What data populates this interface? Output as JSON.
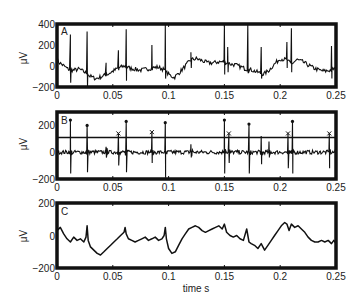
{
  "chart_data": [
    {
      "panel": "A",
      "type": "line",
      "title": "",
      "panel_label": "A",
      "xlabel": "",
      "ylabel": "μV",
      "xlim": [
        0,
        0.25
      ],
      "ylim": [
        -200,
        400
      ],
      "xticks": [
        "0",
        "0.05",
        "0.1",
        "0.15",
        "0.2",
        "0.25"
      ],
      "yticks": [
        "400",
        "200",
        "0",
        "−200"
      ],
      "ytick_values": [
        400,
        200,
        0,
        -200
      ],
      "grid": false,
      "baseline": {
        "x": [
          0,
          0.005,
          0.01,
          0.015,
          0.02,
          0.025,
          0.03,
          0.035,
          0.04,
          0.045,
          0.05,
          0.055,
          0.06,
          0.065,
          0.07,
          0.075,
          0.08,
          0.085,
          0.09,
          0.095,
          0.1,
          0.105,
          0.11,
          0.115,
          0.12,
          0.125,
          0.13,
          0.135,
          0.14,
          0.145,
          0.15,
          0.155,
          0.16,
          0.165,
          0.17,
          0.175,
          0.18,
          0.185,
          0.19,
          0.195,
          0.2,
          0.205,
          0.21,
          0.215,
          0.22,
          0.225,
          0.23,
          0.235,
          0.24,
          0.245,
          0.25
        ],
        "y": [
          50,
          10,
          -30,
          -40,
          -30,
          -60,
          -100,
          -120,
          -100,
          -80,
          -50,
          -20,
          0,
          -20,
          -30,
          -40,
          -30,
          -20,
          -10,
          -30,
          -80,
          -110,
          -60,
          0,
          60,
          70,
          50,
          30,
          30,
          40,
          40,
          20,
          10,
          -10,
          -30,
          -40,
          -60,
          -80,
          -40,
          20,
          70,
          60,
          20,
          60,
          40,
          10,
          -20,
          -40,
          -50,
          -40,
          -20
        ]
      },
      "spikes": [
        {
          "x": 0.012,
          "peak": 300,
          "trough": -160
        },
        {
          "x": 0.027,
          "peak": 330,
          "trough": -200
        },
        {
          "x": 0.044,
          "peak": 30,
          "trough": -60
        },
        {
          "x": 0.055,
          "peak": 150,
          "trough": -40
        },
        {
          "x": 0.062,
          "peak": 350,
          "trough": -140
        },
        {
          "x": 0.085,
          "peak": 200,
          "trough": -40
        },
        {
          "x": 0.097,
          "peak": 400,
          "trough": -120
        },
        {
          "x": 0.12,
          "peak": 130,
          "trough": -20
        },
        {
          "x": 0.15,
          "peak": 390,
          "trough": -80
        },
        {
          "x": 0.153,
          "peak": 180,
          "trough": -60
        },
        {
          "x": 0.171,
          "peak": 400,
          "trough": -70
        },
        {
          "x": 0.183,
          "peak": 180,
          "trough": -120
        },
        {
          "x": 0.206,
          "peak": 230,
          "trough": -20
        },
        {
          "x": 0.21,
          "peak": 360,
          "trough": -60
        },
        {
          "x": 0.246,
          "peak": 190,
          "trough": -120
        }
      ]
    },
    {
      "panel": "B",
      "type": "line",
      "title": "",
      "panel_label": "B",
      "xlabel": "",
      "ylabel": "μV",
      "xlim": [
        0,
        0.25
      ],
      "ylim": [
        -200,
        300
      ],
      "xticks": [
        "0",
        "0.05",
        "0.1",
        "0.15",
        "0.2",
        "0.25"
      ],
      "yticks": [
        "200",
        "0",
        "−200"
      ],
      "ytick_values": [
        200,
        0,
        -200
      ],
      "grid": false,
      "threshold": 110,
      "spikes": [
        {
          "x": 0.012,
          "peak": 240,
          "trough": -160,
          "marker": "dot"
        },
        {
          "x": 0.027,
          "peak": 200,
          "trough": -150,
          "marker": "dot"
        },
        {
          "x": 0.044,
          "peak": 40,
          "trough": -40,
          "marker": "none"
        },
        {
          "x": 0.055,
          "peak": 140,
          "trough": -100,
          "marker": "x"
        },
        {
          "x": 0.062,
          "peak": 230,
          "trough": -150,
          "marker": "dot"
        },
        {
          "x": 0.085,
          "peak": 150,
          "trough": -80,
          "marker": "x"
        },
        {
          "x": 0.097,
          "peak": 220,
          "trough": -190,
          "marker": "dot"
        },
        {
          "x": 0.12,
          "peak": 60,
          "trough": -40,
          "marker": "none"
        },
        {
          "x": 0.15,
          "peak": 240,
          "trough": -160,
          "marker": "dot"
        },
        {
          "x": 0.154,
          "peak": 140,
          "trough": -80,
          "marker": "x"
        },
        {
          "x": 0.172,
          "peak": 210,
          "trough": -160,
          "marker": "dot"
        },
        {
          "x": 0.183,
          "peak": 120,
          "trough": -90,
          "marker": "none"
        },
        {
          "x": 0.19,
          "peak": 80,
          "trough": -40,
          "marker": "none"
        },
        {
          "x": 0.207,
          "peak": 140,
          "trough": -120,
          "marker": "x"
        },
        {
          "x": 0.211,
          "peak": 230,
          "trough": -160,
          "marker": "dot"
        },
        {
          "x": 0.244,
          "peak": 140,
          "trough": -120,
          "marker": "x"
        }
      ]
    },
    {
      "panel": "C",
      "type": "line",
      "title": "",
      "panel_label": "C",
      "xlabel": "time s",
      "ylabel": "μV",
      "xlim": [
        0,
        0.25
      ],
      "ylim": [
        -200,
        200
      ],
      "xticks": [
        "0",
        "0.05",
        "0.1",
        "0.15",
        "0.2",
        "0.25"
      ],
      "yticks": [
        "200",
        "0",
        "−200"
      ],
      "ytick_values": [
        200,
        0,
        -200
      ],
      "grid": false,
      "x": [
        0,
        0.003,
        0.006,
        0.009,
        0.012,
        0.015,
        0.018,
        0.021,
        0.024,
        0.026,
        0.027,
        0.028,
        0.03,
        0.033,
        0.036,
        0.039,
        0.042,
        0.045,
        0.048,
        0.051,
        0.054,
        0.057,
        0.06,
        0.061,
        0.062,
        0.064,
        0.067,
        0.07,
        0.073,
        0.076,
        0.079,
        0.082,
        0.085,
        0.088,
        0.091,
        0.094,
        0.096,
        0.097,
        0.098,
        0.1,
        0.103,
        0.106,
        0.109,
        0.112,
        0.115,
        0.118,
        0.121,
        0.124,
        0.127,
        0.13,
        0.133,
        0.136,
        0.139,
        0.142,
        0.145,
        0.148,
        0.15,
        0.152,
        0.155,
        0.158,
        0.161,
        0.164,
        0.167,
        0.17,
        0.172,
        0.174,
        0.177,
        0.18,
        0.183,
        0.186,
        0.189,
        0.192,
        0.195,
        0.198,
        0.201,
        0.204,
        0.206,
        0.208,
        0.21,
        0.213,
        0.216,
        0.219,
        0.222,
        0.225,
        0.228,
        0.231,
        0.234,
        0.237,
        0.24,
        0.243,
        0.246,
        0.248,
        0.25
      ],
      "y": [
        30,
        50,
        10,
        -20,
        -40,
        -10,
        -30,
        -20,
        -40,
        -10,
        60,
        -30,
        -70,
        -90,
        -110,
        -120,
        -100,
        -80,
        -60,
        -40,
        -20,
        0,
        20,
        50,
        10,
        -20,
        -30,
        -40,
        -30,
        -20,
        -10,
        -30,
        -20,
        -10,
        -30,
        -20,
        0,
        50,
        -20,
        -80,
        -110,
        -100,
        -60,
        -20,
        10,
        40,
        50,
        60,
        50,
        30,
        20,
        30,
        40,
        50,
        60,
        40,
        70,
        20,
        0,
        -10,
        0,
        -20,
        -30,
        40,
        -40,
        -50,
        -60,
        -80,
        -50,
        -90,
        -60,
        -30,
        0,
        30,
        60,
        80,
        70,
        30,
        70,
        50,
        60,
        40,
        20,
        -10,
        -30,
        -40,
        -40,
        -30,
        -40,
        -30,
        -50,
        -30,
        -50
      ]
    }
  ],
  "figure": {
    "panels": [
      "A",
      "B",
      "C"
    ],
    "shared_xlabel": "time s"
  }
}
